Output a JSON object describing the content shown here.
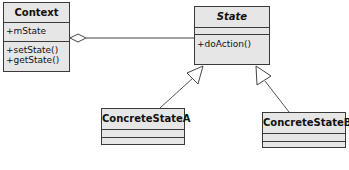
{
  "diagram": {
    "type": "UML class diagram",
    "classes": {
      "context": {
        "name": "Context",
        "attributes": [
          "+mState"
        ],
        "methods": [
          "+setState()",
          "+getState()"
        ]
      },
      "state": {
        "name": "State",
        "abstract": true,
        "attributes": [],
        "methods": [
          "+doAction()"
        ]
      },
      "concrete_a": {
        "name": "ConcreteStateA",
        "attributes": [],
        "methods": []
      },
      "concrete_b": {
        "name": "ConcreteStateB",
        "attributes": [],
        "methods": []
      }
    },
    "relations": [
      {
        "type": "aggregation",
        "from": "Context",
        "to": "State"
      },
      {
        "type": "generalization",
        "from": "ConcreteStateA",
        "to": "State"
      },
      {
        "type": "generalization",
        "from": "ConcreteStateB",
        "to": "State"
      }
    ],
    "colors": {
      "box_fill": "#e6e6e6",
      "stroke": "#3a3a3a",
      "background": "#ffffff"
    }
  }
}
